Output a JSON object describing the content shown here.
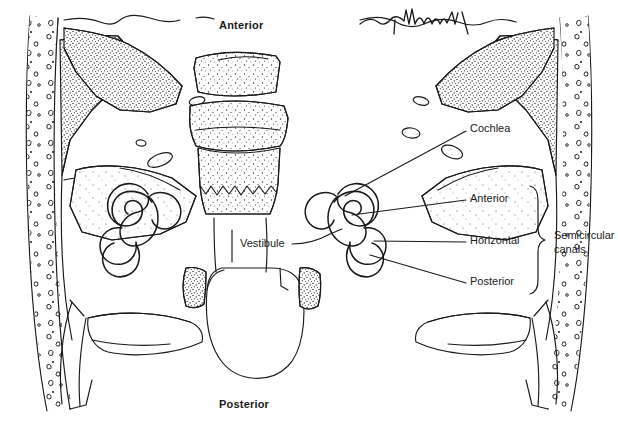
{
  "figure": {
    "kind": "anatomical-line-drawing",
    "background_color": "#ffffff",
    "ink_color": "#1a1a1a",
    "artist_signature": "McNeill"
  },
  "orientation_labels": {
    "top": "Anterior",
    "bottom": "Posterior"
  },
  "callout_labels": [
    {
      "id": "cochlea",
      "text": "Cochlea",
      "x": 470,
      "y": 122,
      "leader_from": [
        466,
        131
      ],
      "leader_to": [
        345,
        196
      ]
    },
    {
      "id": "anterior",
      "text": "Anterior",
      "x": 470,
      "y": 192,
      "leader_from": [
        466,
        200
      ],
      "leader_to": [
        352,
        215
      ]
    },
    {
      "id": "horizontal",
      "text": "Horizontal",
      "x": 470,
      "y": 234,
      "leader_from": [
        466,
        242
      ],
      "leader_to": [
        374,
        241
      ]
    },
    {
      "id": "posterior",
      "text": "Posterior",
      "x": 470,
      "y": 275,
      "leader_from": [
        466,
        283
      ],
      "leader_to": [
        370,
        255
      ]
    },
    {
      "id": "vestibule",
      "text": "Vestibule",
      "x": 240,
      "y": 237,
      "leader_from": [
        292,
        244
      ],
      "leader_to": [
        340,
        230
      ]
    }
  ],
  "group_bracket": {
    "label_line_1": "Semicircular",
    "label_line_2": "canals",
    "label_x": 554,
    "label_y": 236,
    "brace_x": 536,
    "brace_top": 186,
    "brace_bottom": 294
  },
  "structures": [
    {
      "name": "left-bony-labyrinth",
      "side": "left",
      "parts": [
        "cochlea",
        "vestibule",
        "anterior-semicircular-canal",
        "horizontal-semicircular-canal",
        "posterior-semicircular-canal"
      ]
    },
    {
      "name": "right-bony-labyrinth",
      "side": "right",
      "parts": [
        "cochlea",
        "vestibule",
        "anterior-semicircular-canal",
        "horizontal-semicircular-canal",
        "posterior-semicircular-canal"
      ]
    },
    {
      "name": "foramen-magnum",
      "side": "center"
    },
    {
      "name": "vertebral-bodies",
      "side": "center"
    },
    {
      "name": "cranial-vault-diploe",
      "side": "both"
    }
  ]
}
